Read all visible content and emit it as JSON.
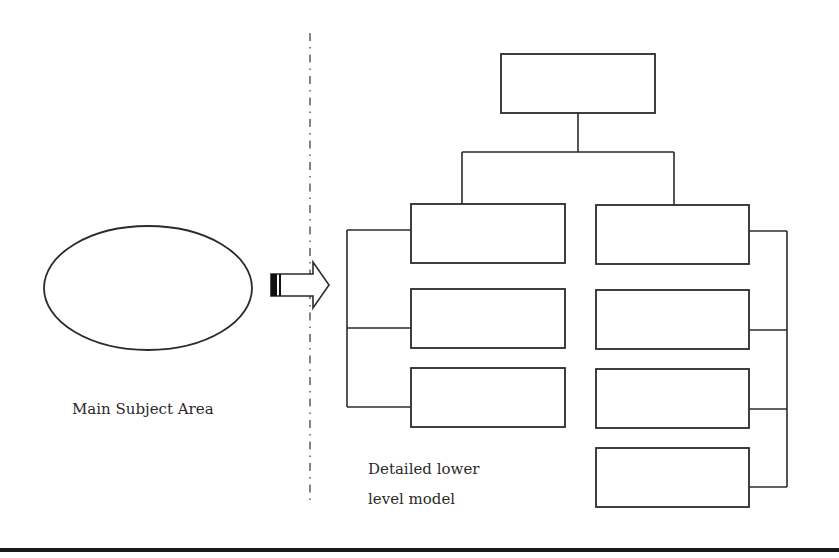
{
  "labels": {
    "main_subject": "Main Subject Area",
    "detailed_line1": "Detailed lower",
    "detailed_line2": "level model"
  },
  "colors": {
    "stroke": "#2b2b2b",
    "background": "#ffffff",
    "arrow_band": "#111111"
  },
  "diagram": {
    "ellipse": {
      "cx": 148,
      "cy": 288,
      "rx": 104,
      "ry": 62
    },
    "separator_x": 310,
    "top_box": {
      "x": 501,
      "y": 54,
      "w": 154,
      "h": 59
    },
    "left_boxes": [
      {
        "x": 411,
        "y": 204,
        "w": 154,
        "h": 59
      },
      {
        "x": 411,
        "y": 289,
        "w": 154,
        "h": 59
      },
      {
        "x": 411,
        "y": 368,
        "w": 154,
        "h": 59
      }
    ],
    "right_boxes": [
      {
        "x": 596,
        "y": 205,
        "w": 153,
        "h": 59
      },
      {
        "x": 596,
        "y": 290,
        "w": 153,
        "h": 59
      },
      {
        "x": 596,
        "y": 369,
        "w": 153,
        "h": 59
      },
      {
        "x": 596,
        "y": 448,
        "w": 153,
        "h": 59
      }
    ]
  }
}
